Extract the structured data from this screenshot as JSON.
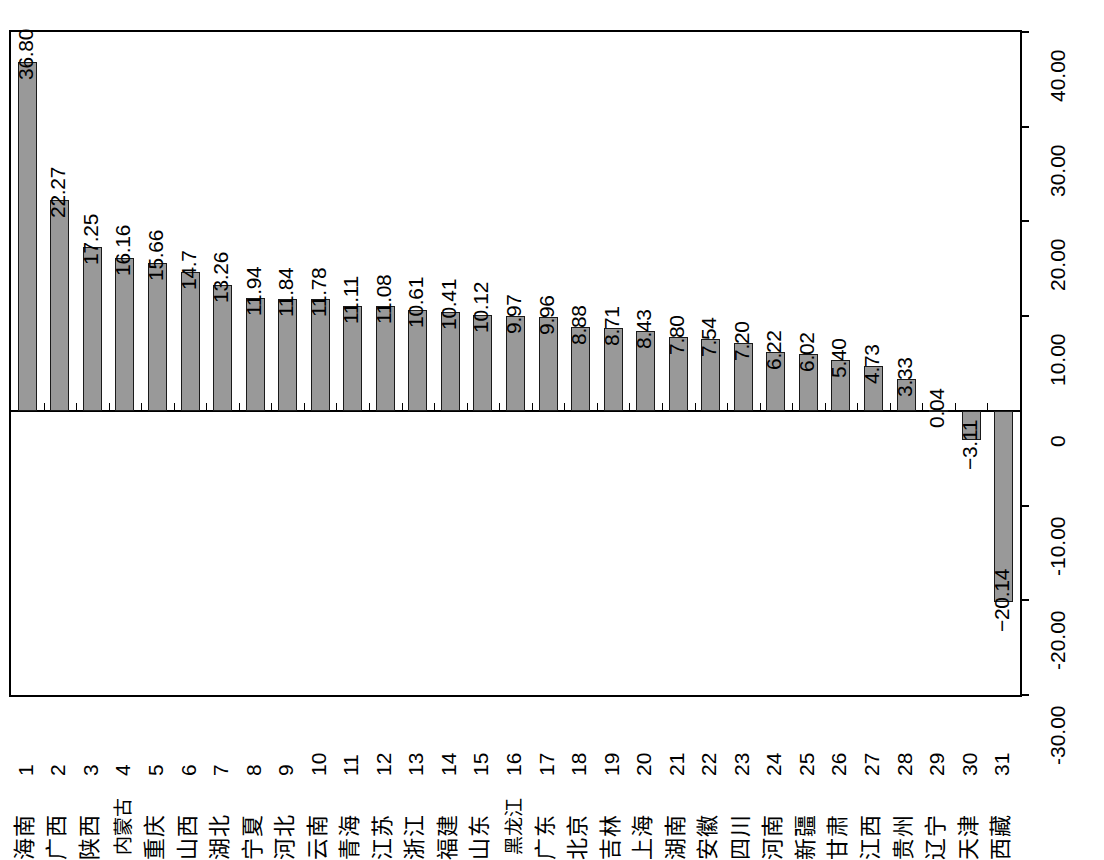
{
  "chart_data": {
    "type": "bar",
    "title": "",
    "subtitle": "",
    "xlabel": "",
    "ylabel": "",
    "ylim": [
      -30,
      40
    ],
    "yticks": [
      "40.00",
      "30.00",
      "20.00",
      "10.00",
      "0",
      "-10.00",
      "-20.00",
      "-30.00"
    ],
    "ytick_values": [
      40,
      30,
      20,
      10,
      0,
      -10,
      -20,
      -30
    ],
    "grid": false,
    "legend": null,
    "orientation": "vertical",
    "bar_color": "#999999",
    "bar_border_color": "#1a1a1a",
    "indices": [
      "1",
      "2",
      "3",
      "4",
      "5",
      "6",
      "7",
      "8",
      "9",
      "10",
      "11",
      "12",
      "13",
      "14",
      "15",
      "16",
      "17",
      "18",
      "19",
      "20",
      "21",
      "22",
      "23",
      "24",
      "25",
      "26",
      "27",
      "28",
      "29",
      "30",
      "31"
    ],
    "categories": [
      "海南",
      "广西",
      "陕西",
      "内蒙古",
      "重庆",
      "山西",
      "湖北",
      "宁夏",
      "河北",
      "云南",
      "青海",
      "江苏",
      "浙江",
      "福建",
      "山东",
      "黑龙江",
      "广东",
      "北京",
      "吉林",
      "上海",
      "湖南",
      "安徽",
      "四川",
      "河南",
      "新疆",
      "甘肃",
      "江西",
      "贵州",
      "辽宁",
      "天津",
      "西藏"
    ],
    "values": [
      36.8,
      22.27,
      17.25,
      16.16,
      15.66,
      14.7,
      13.26,
      11.94,
      11.84,
      11.78,
      11.11,
      11.08,
      10.61,
      10.41,
      10.12,
      9.97,
      9.96,
      8.88,
      8.71,
      8.43,
      7.8,
      7.54,
      7.2,
      6.22,
      6.02,
      5.4,
      4.73,
      3.33,
      0.04,
      -3.11,
      -20.14
    ],
    "data_labels": [
      "36.80",
      "22.27",
      "17.25",
      "16.16",
      "15.66",
      "14.7",
      "13.26",
      "11.94",
      "11.84",
      "11.78",
      "11.11",
      "11.08",
      "10.61",
      "10.41",
      "10.12",
      "9.97",
      "9.96",
      "8.88",
      "8.71",
      "8.43",
      "7.80",
      "7.54",
      "7.20",
      "6.22",
      "6.02",
      "5.40",
      "4.73",
      "3.33",
      "0.04",
      "−3.11",
      "−20.14"
    ]
  }
}
